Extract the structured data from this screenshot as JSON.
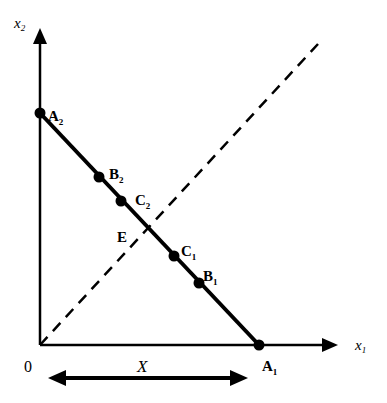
{
  "diagram": {
    "axes": {
      "x_label": "x",
      "x_sub": "1",
      "y_label": "x",
      "y_sub": "2",
      "origin_label": "0"
    },
    "points": [
      {
        "id": "A2",
        "label": "A",
        "sub": "2"
      },
      {
        "id": "B2",
        "label": "B",
        "sub": "2"
      },
      {
        "id": "C2",
        "label": "C",
        "sub": "2"
      },
      {
        "id": "E",
        "label": "E",
        "sub": ""
      },
      {
        "id": "C1",
        "label": "C",
        "sub": "1"
      },
      {
        "id": "B1",
        "label": "B",
        "sub": "1"
      },
      {
        "id": "A1",
        "label": "A",
        "sub": "1"
      }
    ],
    "width_label": "X",
    "line_styles": {
      "budget_line": "solid",
      "diagonal": "dashed"
    },
    "colors": {
      "ink": "#000000",
      "background": "#ffffff"
    }
  }
}
